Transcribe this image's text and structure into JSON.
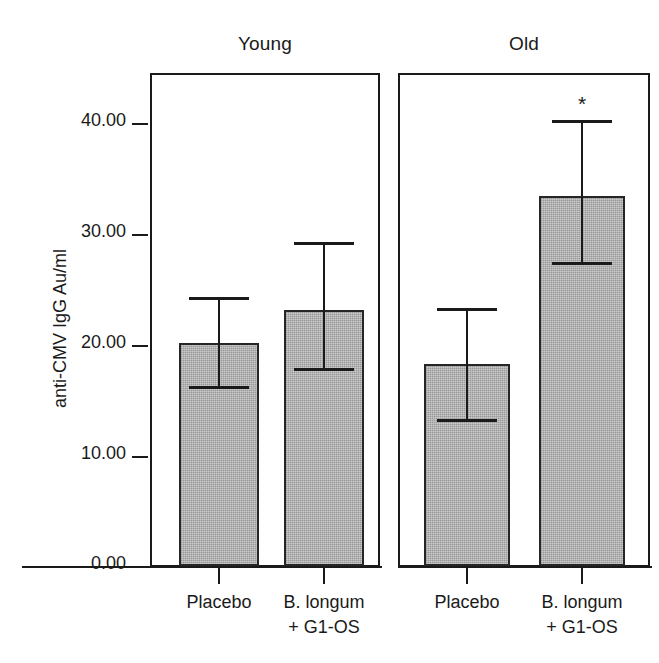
{
  "chart_data": {
    "type": "bar",
    "title": "",
    "xlabel": "",
    "ylabel": "anti-CMV IgG Au/ml",
    "ylim": [
      0,
      44.5
    ],
    "yticks": [
      "0.00",
      "10.00",
      "20.00",
      "30.00",
      "40.00"
    ],
    "ytick_values": [
      0,
      10,
      20,
      30,
      40
    ],
    "grid": false,
    "legend": "none",
    "error_bars": "yes",
    "panels": [
      {
        "name": "young-panel",
        "title": "Young",
        "categories": [
          "Placebo",
          "B. longum + G1-OS"
        ],
        "bars": [
          {
            "label_line1": "Placebo",
            "label_line2": "",
            "value": 20.1,
            "err_low": 16.0,
            "err_high": 24.0,
            "significance": ""
          },
          {
            "label_line1": "B. longum",
            "label_line2": "+ G1-OS",
            "value": 23.1,
            "err_low": 17.6,
            "err_high": 29.0,
            "significance": ""
          }
        ]
      },
      {
        "name": "old-panel",
        "title": "Old",
        "categories": [
          "Placebo",
          "B. longum + G1-OS"
        ],
        "bars": [
          {
            "label_line1": "Placebo",
            "label_line2": "",
            "value": 18.2,
            "err_low": 13.0,
            "err_high": 23.0,
            "significance": ""
          },
          {
            "label_line1": "B. longum",
            "label_line2": "+ G1-OS",
            "value": 33.4,
            "err_low": 27.2,
            "err_high": 40.0,
            "significance": "*"
          }
        ]
      }
    ],
    "colors": {
      "bar_fill": "#ababab",
      "bar_edge": "#262626",
      "axis": "#1a1a1a",
      "background": "#ffffff"
    }
  }
}
